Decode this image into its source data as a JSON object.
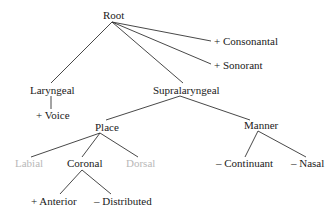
{
  "diagram": {
    "type": "feature-geometry-tree",
    "nodes": {
      "root": {
        "label": "Root"
      },
      "consonantal": {
        "label": "+ Consonantal"
      },
      "sonorant": {
        "label": "+ Sonorant"
      },
      "laryngeal": {
        "label": "Laryngeal"
      },
      "voice": {
        "label": "+ Voice"
      },
      "supralaryngeal": {
        "label": "Supralaryngeal"
      },
      "place": {
        "label": "Place"
      },
      "manner": {
        "label": "Manner"
      },
      "labial": {
        "label": "Labial",
        "dimmed": true
      },
      "coronal": {
        "label": "Coronal"
      },
      "dorsal": {
        "label": "Dorsal",
        "dimmed": true
      },
      "continuant": {
        "label": "– Continuant"
      },
      "nasal": {
        "label": "– Nasal"
      },
      "anterior": {
        "label": "+ Anterior"
      },
      "distributed": {
        "label": "– Distributed"
      }
    },
    "edges": [
      [
        "root",
        "laryngeal"
      ],
      [
        "root",
        "supralaryngeal"
      ],
      [
        "root",
        "consonantal"
      ],
      [
        "root",
        "sonorant"
      ],
      [
        "laryngeal",
        "voice"
      ],
      [
        "supralaryngeal",
        "place"
      ],
      [
        "supralaryngeal",
        "manner"
      ],
      [
        "place",
        "labial"
      ],
      [
        "place",
        "coronal"
      ],
      [
        "place",
        "dorsal"
      ],
      [
        "coronal",
        "anterior"
      ],
      [
        "coronal",
        "distributed"
      ],
      [
        "manner",
        "continuant"
      ],
      [
        "manner",
        "nasal"
      ]
    ],
    "colors": {
      "line": "#333333",
      "text": "#1a1a1a",
      "dimmed_text": "#b8b8b8"
    }
  }
}
